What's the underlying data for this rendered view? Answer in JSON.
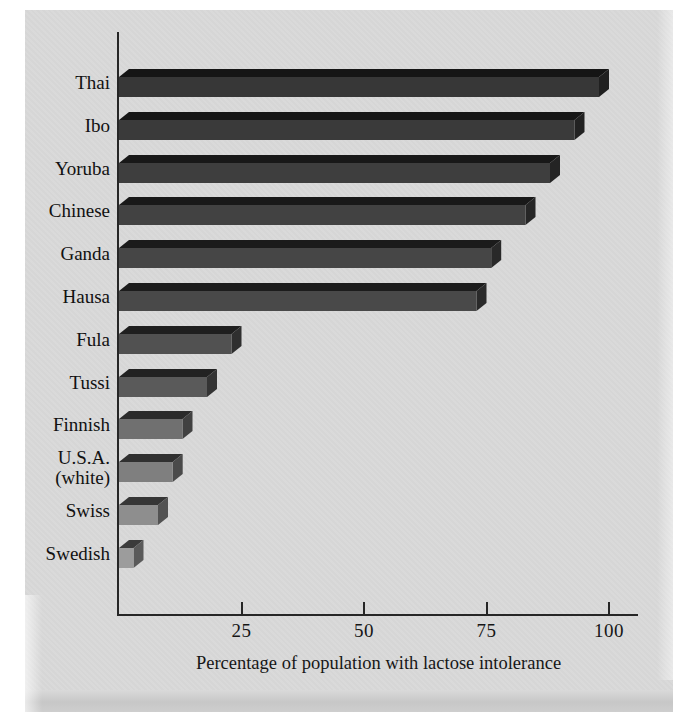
{
  "figure": {
    "kind": "scanned-textbook-bar-chart",
    "page_bg": "#ffffff",
    "panel_bg": "#d9d9d9",
    "axis_color": "#262626",
    "text_color": "#161616"
  },
  "chart_data": {
    "type": "bar",
    "orientation": "horizontal",
    "style": "3d-oblique",
    "title": "",
    "xlabel": "Percentage of population with lactose intolerance",
    "ylabel": "",
    "xlim": [
      0,
      106
    ],
    "xticks": [
      25,
      50,
      75,
      100
    ],
    "grid": false,
    "legend": "none",
    "categories": [
      "Thai",
      "Ibo",
      "Yoruba",
      "Chinese",
      "Ganda",
      "Hausa",
      "Fula",
      "Tussi",
      "Finnish",
      "U.S.A. (white)",
      "Swiss",
      "Swedish"
    ],
    "category_lines": [
      [
        "Thai"
      ],
      [
        "Ibo"
      ],
      [
        "Yoruba"
      ],
      [
        "Chinese"
      ],
      [
        "Ganda"
      ],
      [
        "Hausa"
      ],
      [
        "Fula"
      ],
      [
        "Tussi"
      ],
      [
        "Finnish"
      ],
      [
        "U.S.A.",
        "(white)"
      ],
      [
        "Swiss"
      ],
      [
        "Swedish"
      ]
    ],
    "values": [
      100,
      95,
      90,
      85,
      78,
      75,
      25,
      20,
      15,
      13,
      10,
      5
    ],
    "bar_colors": [
      "#373737",
      "#3a3a3a",
      "#3e3e3e",
      "#424242",
      "#464646",
      "#494949",
      "#515151",
      "#5a5a5a",
      "#707070",
      "#7f7f7f",
      "#8e8e8e",
      "#9c9c9c"
    ]
  }
}
